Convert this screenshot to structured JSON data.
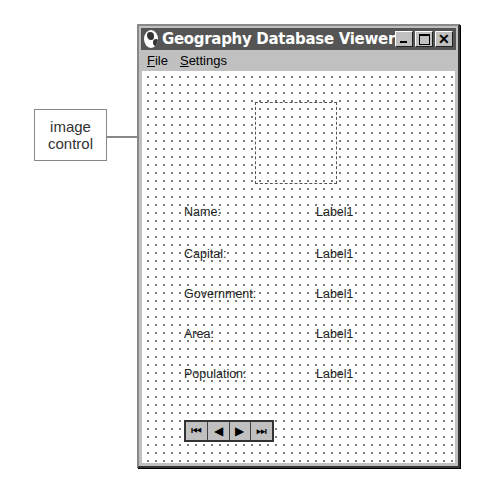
{
  "callout": {
    "line1": "image",
    "line2": "control"
  },
  "window": {
    "title": "Geography Database Viewer",
    "buttons": {
      "minimize": "_",
      "maximize": "□",
      "close": "✕"
    }
  },
  "menu": [
    {
      "mnemonic": "F",
      "rest": "ile"
    },
    {
      "mnemonic": "S",
      "rest": "ettings"
    }
  ],
  "fields": [
    {
      "label": "Name:",
      "value": "Label1"
    },
    {
      "label": "Capital:",
      "value": "Label1"
    },
    {
      "label": "Government:",
      "value": "Label1"
    },
    {
      "label": "Area:",
      "value": "Label1"
    },
    {
      "label": "Population:",
      "value": "Label1"
    }
  ],
  "navigator": {
    "first": "⏮",
    "prev": "◀",
    "next": "▶",
    "last": "⏭"
  }
}
